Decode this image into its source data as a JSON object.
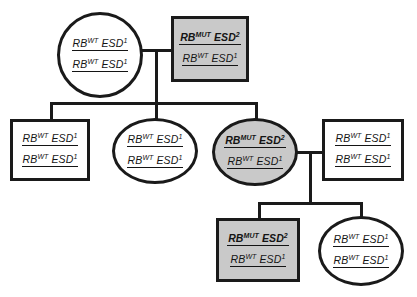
{
  "diagram": {
    "type": "pedigree",
    "colors": {
      "affected_fill": "#c9c9c9",
      "unaffected_fill": "#ffffff",
      "stroke": "#1a1a1a"
    },
    "legend_symbols": {
      "square": "male",
      "circle": "female",
      "shaded": "affected",
      "unshaded": "unaffected"
    }
  },
  "generations": [
    {
      "id": "I",
      "individuals": [
        {
          "id": "I-1",
          "shape": "circle",
          "sex": "female",
          "affected": false,
          "alleles": [
            {
              "gene": "RB",
              "gene_sup": "WT",
              "marker": "ESD",
              "marker_sup": "1",
              "bold": false
            },
            {
              "gene": "RB",
              "gene_sup": "WT",
              "marker": "ESD",
              "marker_sup": "1",
              "bold": false
            }
          ]
        },
        {
          "id": "I-2",
          "shape": "square",
          "sex": "male",
          "affected": true,
          "alleles": [
            {
              "gene": "RB",
              "gene_sup": "MUT",
              "marker": "ESD",
              "marker_sup": "2",
              "bold": true
            },
            {
              "gene": "RB",
              "gene_sup": "WT",
              "marker": "ESD",
              "marker_sup": "1",
              "bold": false
            }
          ]
        }
      ]
    },
    {
      "id": "II",
      "individuals": [
        {
          "id": "II-1",
          "shape": "square",
          "sex": "male",
          "affected": false,
          "alleles": [
            {
              "gene": "RB",
              "gene_sup": "WT",
              "marker": "ESD",
              "marker_sup": "1",
              "bold": false
            },
            {
              "gene": "RB",
              "gene_sup": "WT",
              "marker": "ESD",
              "marker_sup": "1",
              "bold": false
            }
          ]
        },
        {
          "id": "II-2",
          "shape": "circle",
          "sex": "female",
          "affected": false,
          "alleles": [
            {
              "gene": "RB",
              "gene_sup": "WT",
              "marker": "ESD",
              "marker_sup": "1",
              "bold": false
            },
            {
              "gene": "RB",
              "gene_sup": "WT",
              "marker": "ESD",
              "marker_sup": "1",
              "bold": false
            }
          ]
        },
        {
          "id": "II-3",
          "shape": "circle",
          "sex": "female",
          "affected": true,
          "alleles": [
            {
              "gene": "RB",
              "gene_sup": "MUT",
              "marker": "ESD",
              "marker_sup": "2",
              "bold": true
            },
            {
              "gene": "RB",
              "gene_sup": "WT",
              "marker": "ESD",
              "marker_sup": "1",
              "bold": false
            }
          ]
        },
        {
          "id": "II-4",
          "shape": "square",
          "sex": "male",
          "affected": false,
          "alleles": [
            {
              "gene": "RB",
              "gene_sup": "WT",
              "marker": "ESD",
              "marker_sup": "1",
              "bold": false
            },
            {
              "gene": "RB",
              "gene_sup": "WT",
              "marker": "ESD",
              "marker_sup": "1",
              "bold": false
            }
          ]
        }
      ]
    },
    {
      "id": "III",
      "individuals": [
        {
          "id": "III-1",
          "shape": "square",
          "sex": "male",
          "affected": true,
          "alleles": [
            {
              "gene": "RB",
              "gene_sup": "MUT",
              "marker": "ESD",
              "marker_sup": "2",
              "bold": true
            },
            {
              "gene": "RB",
              "gene_sup": "WT",
              "marker": "ESD",
              "marker_sup": "1",
              "bold": false
            }
          ]
        },
        {
          "id": "III-2",
          "shape": "circle",
          "sex": "female",
          "affected": false,
          "alleles": [
            {
              "gene": "RB",
              "gene_sup": "WT",
              "marker": "ESD",
              "marker_sup": "1",
              "bold": false
            },
            {
              "gene": "RB",
              "gene_sup": "WT",
              "marker": "ESD",
              "marker_sup": "1",
              "bold": false
            }
          ]
        }
      ]
    }
  ]
}
